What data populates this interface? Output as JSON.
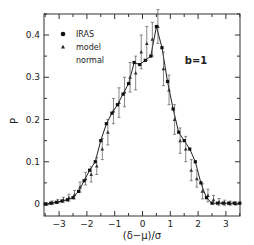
{
  "chart_data": {
    "type": "line",
    "title": "",
    "annotation": "b=1",
    "xlabel": "(δ−μ)/σ",
    "ylabel": "P",
    "xlim": [
      -3.5,
      3.5
    ],
    "ylim": [
      -0.02,
      0.45
    ],
    "xticks": [
      -3,
      -2,
      -1,
      0,
      1,
      2,
      3
    ],
    "yticks": [
      0,
      0.1,
      0.2,
      0.3,
      0.4
    ],
    "ytick_labels": [
      "0",
      "0.1",
      "0.2",
      "0.3",
      "0.4"
    ],
    "grid": false,
    "legend": {
      "position": "upper-left",
      "entries": [
        "IRAS",
        "model",
        "normal"
      ]
    },
    "x": [
      -3.5,
      -3.3,
      -3.1,
      -2.9,
      -2.7,
      -2.5,
      -2.3,
      -2.1,
      -1.9,
      -1.7,
      -1.5,
      -1.3,
      -1.1,
      -0.9,
      -0.7,
      -0.5,
      -0.3,
      -0.1,
      0.1,
      0.3,
      0.5,
      0.7,
      0.9,
      1.1,
      1.3,
      1.5,
      1.7,
      1.9,
      2.1,
      2.3,
      2.5,
      2.7,
      2.9,
      3.1,
      3.3,
      3.5
    ],
    "series": [
      {
        "name": "IRAS",
        "marker": "filled-square",
        "values": [
          0.0,
          0.002,
          0.004,
          0.007,
          0.01,
          0.015,
          0.03,
          0.055,
          0.08,
          0.1,
          0.15,
          0.19,
          0.215,
          0.235,
          0.26,
          0.285,
          0.335,
          0.33,
          0.34,
          0.35,
          0.42,
          0.37,
          0.29,
          0.225,
          0.17,
          0.15,
          0.13,
          0.1,
          0.05,
          0.015,
          0.002,
          0.002,
          0.002,
          0.002,
          0.002,
          0.002
        ]
      },
      {
        "name": "model",
        "marker": "triangle",
        "values": [
          0.0,
          0.003,
          0.006,
          0.01,
          0.015,
          0.022,
          0.04,
          0.06,
          0.07,
          0.09,
          0.13,
          0.17,
          0.22,
          0.24,
          0.265,
          0.3,
          0.31,
          0.36,
          0.38,
          0.39,
          0.42,
          0.32,
          0.27,
          0.2,
          0.15,
          0.13,
          0.08,
          0.06,
          0.03,
          0.02,
          0.01,
          0.005,
          0.003,
          0.002,
          0.001,
          0.0
        ],
        "errors": [
          0.003,
          0.004,
          0.005,
          0.006,
          0.008,
          0.01,
          0.012,
          0.015,
          0.018,
          0.02,
          0.025,
          0.03,
          0.03,
          0.035,
          0.035,
          0.035,
          0.04,
          0.04,
          0.04,
          0.04,
          0.04,
          0.04,
          0.035,
          0.035,
          0.03,
          0.03,
          0.025,
          0.02,
          0.018,
          0.015,
          0.01,
          0.008,
          0.006,
          0.005,
          0.004,
          0.003
        ]
      },
      {
        "name": "normal",
        "line": "solid",
        "values": [
          0.0,
          0.002,
          0.004,
          0.007,
          0.01,
          0.015,
          0.03,
          0.055,
          0.08,
          0.1,
          0.15,
          0.19,
          0.215,
          0.235,
          0.26,
          0.285,
          0.335,
          0.33,
          0.34,
          0.35,
          0.42,
          0.37,
          0.29,
          0.225,
          0.17,
          0.15,
          0.13,
          0.1,
          0.05,
          0.015,
          0.002,
          0.002,
          0.002,
          0.002,
          0.002,
          0.002
        ]
      }
    ]
  }
}
